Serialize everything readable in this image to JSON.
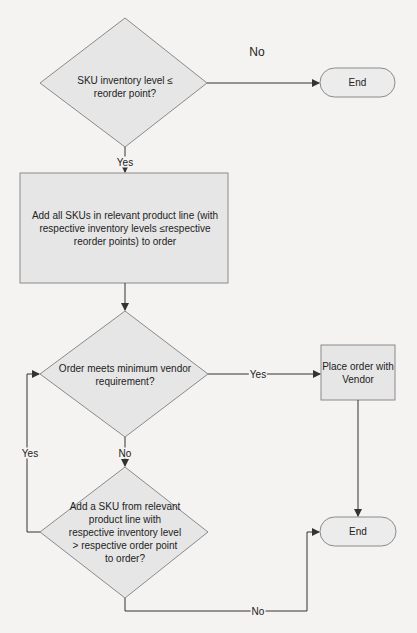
{
  "diagram": {
    "type": "flowchart",
    "colors": {
      "shape_fill": "#e6e6e6",
      "shape_stroke": "#8a8a8a",
      "line": "#333333",
      "background": "#f4f3f1"
    },
    "nodes": {
      "decision_reorder": {
        "shape": "diamond",
        "label": "SKU inventory level ≤ reorder point?"
      },
      "end_top": {
        "shape": "terminator",
        "label": "End"
      },
      "add_all_skus": {
        "shape": "process",
        "label": "Add all SKUs in relevant product line (with respective inventory levels ≤respective reorder points) to order"
      },
      "decision_min_vendor": {
        "shape": "diamond",
        "label": "Order meets minimum vendor requirement?"
      },
      "place_order": {
        "shape": "process",
        "label": "Place order with Vendor"
      },
      "decision_add_sku": {
        "shape": "diamond",
        "label": "Add a SKU from relevant product line with respective inventory level > respective order point to order?"
      },
      "end_bottom": {
        "shape": "terminator",
        "label": "End"
      }
    },
    "edges": [
      {
        "from": "decision_reorder",
        "to": "end_top",
        "label": "No"
      },
      {
        "from": "decision_reorder",
        "to": "add_all_skus",
        "label": "Yes"
      },
      {
        "from": "add_all_skus",
        "to": "decision_min_vendor",
        "label": ""
      },
      {
        "from": "decision_min_vendor",
        "to": "place_order",
        "label": "Yes"
      },
      {
        "from": "decision_min_vendor",
        "to": "decision_add_sku",
        "label": "No"
      },
      {
        "from": "decision_add_sku",
        "to": "decision_min_vendor",
        "label": "Yes"
      },
      {
        "from": "decision_add_sku",
        "to": "end_bottom",
        "label": "No"
      },
      {
        "from": "place_order",
        "to": "end_bottom",
        "label": ""
      }
    ]
  }
}
